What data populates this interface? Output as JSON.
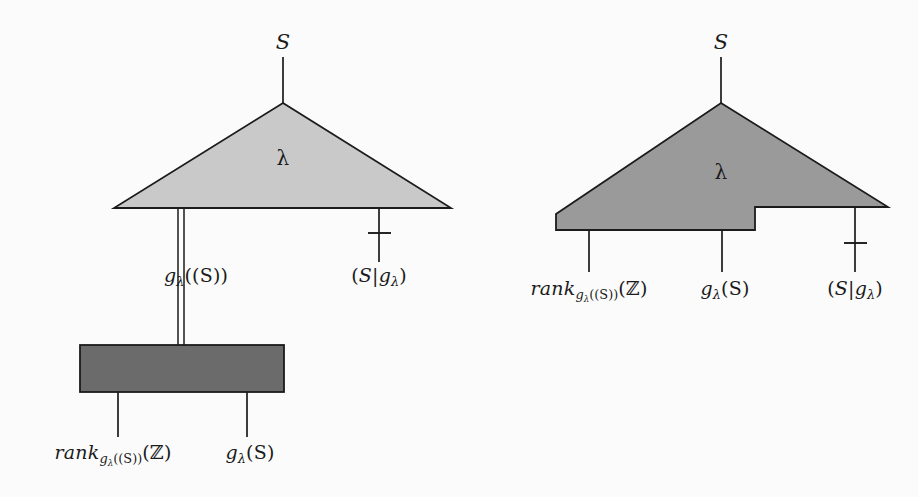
{
  "figure": {
    "background_color": "#fbfbfb",
    "ink_color": "#1b1b1b",
    "panels": [
      {
        "id": "left",
        "name": "left-diagram",
        "triangle_fill": "#c9c9c9",
        "box_fill": "#6b6b6b",
        "top_wire_label": "S",
        "node_label": "λ",
        "output_labels": [
          {
            "text_parts": {
              "base": "g",
              "sub": "λ",
              "args": "((S))"
            },
            "plain": "gλ((S))",
            "wire_style": "double"
          },
          {
            "text_parts": {
              "open": "(",
              "first": "S",
              "bar": "|",
              "base": "g",
              "sub": "λ",
              "close": ")"
            },
            "plain": "(S|gλ)",
            "wire_style": "single-tick"
          }
        ],
        "box_output_labels": [
          {
            "plain": "rank_{gλ((S))}(ℤ)",
            "base": "rank",
            "sub_base": "g",
            "sub_sub": "λ",
            "sub_args": "((S))",
            "tail": "(ℤ)"
          },
          {
            "plain": "gλ(S)",
            "base": "g",
            "sub": "λ",
            "args": "(S)"
          }
        ]
      },
      {
        "id": "right",
        "name": "right-diagram",
        "triangle_fill": "#9a9a9a",
        "top_wire_label": "S",
        "node_label": "λ",
        "output_labels": [
          {
            "plain": "rank_{gλ((S))}(ℤ)",
            "base": "rank",
            "sub_base": "g",
            "sub_sub": "λ",
            "sub_args": "((S))",
            "tail": "(ℤ)",
            "wire_style": "single"
          },
          {
            "plain": "gλ(S)",
            "base": "g",
            "sub": "λ",
            "args": "(S)",
            "wire_style": "single"
          },
          {
            "plain": "(S|gλ)",
            "open": "(",
            "first": "S",
            "bar": "|",
            "base": "g",
            "sub": "λ",
            "close": ")",
            "wire_style": "single-tick"
          }
        ]
      }
    ]
  }
}
